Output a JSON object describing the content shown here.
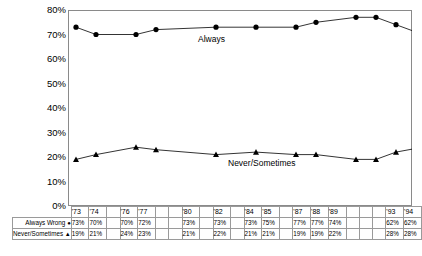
{
  "chart_data": {
    "type": "line",
    "title": "",
    "xlabel": "",
    "ylabel": "",
    "ylim": [
      0,
      80
    ],
    "ytick_labels": [
      "80%",
      "70%",
      "60%",
      "50%",
      "40%",
      "30%",
      "20%",
      "10%",
      "0%"
    ],
    "ytick_values": [
      80,
      70,
      60,
      50,
      40,
      30,
      20,
      10,
      0
    ],
    "grid": false,
    "legend_position": "inline-annotations",
    "x_slots": [
      "'73",
      "'74",
      "",
      "'76",
      "'77",
      "",
      "",
      "'80",
      "",
      "'82",
      "",
      "'84",
      "'85",
      "",
      "'87",
      "'88",
      "'89",
      "",
      "",
      "",
      "'93",
      "'94"
    ],
    "categories": [
      "'73",
      "'74",
      "'76",
      "'77",
      "'80",
      "'82",
      "'84",
      "'85",
      "'87",
      "'88",
      "'89",
      "'93",
      "'94"
    ],
    "series": [
      {
        "name": "Always Wrong",
        "annotation": "Always",
        "marker": "circle",
        "color": "#000000",
        "slots": [
          0,
          1,
          3,
          4,
          7,
          9,
          11,
          12,
          14,
          15,
          16,
          20,
          21
        ],
        "values": [
          73,
          70,
          70,
          72,
          73,
          73,
          73,
          75,
          77,
          77,
          74,
          62,
          62
        ],
        "labels": [
          "73%",
          "70%",
          "70%",
          "72%",
          "73%",
          "73%",
          "73%",
          "75%",
          "77%",
          "77%",
          "74%",
          "62%",
          "62%"
        ]
      },
      {
        "name": "Never/Sometimes",
        "annotation": "Never/Sometimes",
        "marker": "triangle",
        "color": "#000000",
        "slots": [
          0,
          1,
          3,
          4,
          7,
          9,
          11,
          12,
          14,
          15,
          16,
          20,
          21
        ],
        "values": [
          19,
          21,
          24,
          23,
          21,
          22,
          21,
          21,
          19,
          19,
          22,
          28,
          28
        ],
        "labels": [
          "19%",
          "21%",
          "24%",
          "23%",
          "21%",
          "22%",
          "21%",
          "21%",
          "19%",
          "19%",
          "22%",
          "28%",
          "28%"
        ]
      }
    ]
  },
  "table": {
    "row_labels": [
      "Always Wrong",
      "Never/Sometimes"
    ],
    "row_markers": [
      "●",
      "▲"
    ]
  }
}
